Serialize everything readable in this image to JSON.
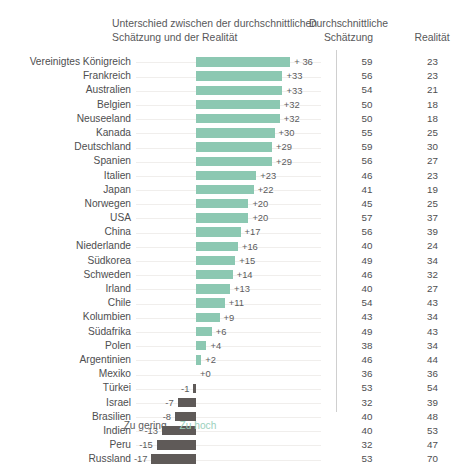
{
  "header": {
    "diff_title": "Unterschied zwischen der durchschnittlichen Schätzung und der Realität",
    "estimate_title": "Durchschnittliche Schätzung",
    "reality_title": "Realität"
  },
  "legend": {
    "low_label": "Zu gering",
    "high_label": "Zu hoch"
  },
  "colors": {
    "positive_bar": "#8cc8b2",
    "negative_bar": "#5f5a58",
    "text": "#4e4e50",
    "divider": "#cfcfcf",
    "leader": "#f0eeec"
  },
  "chart_data": {
    "type": "bar",
    "orientation": "horizontal",
    "title": "Unterschied zwischen der durchschnittlichen Schätzung und der Realität",
    "xlabel": "",
    "ylabel": "",
    "grid": false,
    "legend_position": "bottom",
    "legend_entries": [
      "Zu gering",
      "Zu hoch"
    ],
    "xlim": [
      -20,
      40
    ],
    "columns": [
      "Durchschnittliche Schätzung",
      "Realität"
    ],
    "categories": [
      "Vereinigtes Königreich",
      "Frankreich",
      "Australien",
      "Belgien",
      "Neuseeland",
      "Kanada",
      "Deutschland",
      "Spanien",
      "Italien",
      "Japan",
      "Norwegen",
      "USA",
      "China",
      "Niederlande",
      "Südkorea",
      "Schweden",
      "Irland",
      "Chile",
      "Kolumbien",
      "Südafrika",
      "Polen",
      "Argentinien",
      "Mexiko",
      "Türkei",
      "Israel",
      "Brasilien",
      "Indien",
      "Peru",
      "Russland"
    ],
    "values": [
      36,
      33,
      33,
      32,
      32,
      30,
      29,
      29,
      23,
      22,
      20,
      20,
      17,
      16,
      15,
      14,
      13,
      11,
      9,
      6,
      4,
      2,
      0,
      -1,
      -7,
      -8,
      -13,
      -15,
      -17
    ],
    "series": [
      {
        "name": "Durchschnittliche Schätzung",
        "values": [
          59,
          56,
          54,
          50,
          50,
          55,
          59,
          56,
          46,
          41,
          45,
          57,
          56,
          40,
          49,
          46,
          40,
          54,
          43,
          49,
          38,
          46,
          36,
          53,
          32,
          40,
          40,
          32,
          53
        ]
      },
      {
        "name": "Realität",
        "values": [
          23,
          23,
          21,
          18,
          18,
          25,
          30,
          27,
          23,
          19,
          25,
          37,
          39,
          24,
          34,
          32,
          27,
          43,
          34,
          43,
          34,
          44,
          36,
          54,
          39,
          48,
          53,
          47,
          70
        ]
      }
    ]
  },
  "rows": [
    {
      "country": "Vereinigtes Königreich",
      "diff": 36,
      "diff_label": "+ 36",
      "estimate": 59,
      "reality": 23
    },
    {
      "country": "Frankreich",
      "diff": 33,
      "diff_label": "+33",
      "estimate": 56,
      "reality": 23
    },
    {
      "country": "Australien",
      "diff": 33,
      "diff_label": "+33",
      "estimate": 54,
      "reality": 21
    },
    {
      "country": "Belgien",
      "diff": 32,
      "diff_label": "+32",
      "estimate": 50,
      "reality": 18
    },
    {
      "country": "Neuseeland",
      "diff": 32,
      "diff_label": "+32",
      "estimate": 50,
      "reality": 18
    },
    {
      "country": "Kanada",
      "diff": 30,
      "diff_label": "+30",
      "estimate": 55,
      "reality": 25
    },
    {
      "country": "Deutschland",
      "diff": 29,
      "diff_label": "+29",
      "estimate": 59,
      "reality": 30
    },
    {
      "country": "Spanien",
      "diff": 29,
      "diff_label": "+29",
      "estimate": 56,
      "reality": 27
    },
    {
      "country": "Italien",
      "diff": 23,
      "diff_label": "+23",
      "estimate": 46,
      "reality": 23
    },
    {
      "country": "Japan",
      "diff": 22,
      "diff_label": "+22",
      "estimate": 41,
      "reality": 19
    },
    {
      "country": "Norwegen",
      "diff": 20,
      "diff_label": "+20",
      "estimate": 45,
      "reality": 25
    },
    {
      "country": "USA",
      "diff": 20,
      "diff_label": "+20",
      "estimate": 57,
      "reality": 37
    },
    {
      "country": "China",
      "diff": 17,
      "diff_label": "+17",
      "estimate": 56,
      "reality": 39
    },
    {
      "country": "Niederlande",
      "diff": 16,
      "diff_label": "+16",
      "estimate": 40,
      "reality": 24
    },
    {
      "country": "Südkorea",
      "diff": 15,
      "diff_label": "+15",
      "estimate": 49,
      "reality": 34
    },
    {
      "country": "Schweden",
      "diff": 14,
      "diff_label": "+14",
      "estimate": 46,
      "reality": 32
    },
    {
      "country": "Irland",
      "diff": 13,
      "diff_label": "+13",
      "estimate": 40,
      "reality": 27
    },
    {
      "country": "Chile",
      "diff": 11,
      "diff_label": "+11",
      "estimate": 54,
      "reality": 43
    },
    {
      "country": "Kolumbien",
      "diff": 9,
      "diff_label": "+9",
      "estimate": 43,
      "reality": 34
    },
    {
      "country": "Südafrika",
      "diff": 6,
      "diff_label": "+6",
      "estimate": 49,
      "reality": 43
    },
    {
      "country": "Polen",
      "diff": 4,
      "diff_label": "+4",
      "estimate": 38,
      "reality": 34
    },
    {
      "country": "Argentinien",
      "diff": 2,
      "diff_label": "+2",
      "estimate": 46,
      "reality": 44
    },
    {
      "country": "Mexiko",
      "diff": 0,
      "diff_label": "+0",
      "estimate": 36,
      "reality": 36
    },
    {
      "country": "Türkei",
      "diff": -1,
      "diff_label": "-1",
      "estimate": 53,
      "reality": 54
    },
    {
      "country": "Israel",
      "diff": -7,
      "diff_label": "-7",
      "estimate": 32,
      "reality": 39
    },
    {
      "country": "Brasilien",
      "diff": -8,
      "diff_label": "-8",
      "estimate": 40,
      "reality": 48
    },
    {
      "country": "Indien",
      "diff": -13,
      "diff_label": "-13",
      "estimate": 40,
      "reality": 53
    },
    {
      "country": "Peru",
      "diff": -15,
      "diff_label": "-15",
      "estimate": 32,
      "reality": 47
    },
    {
      "country": "Russland",
      "diff": -17,
      "diff_label": "-17",
      "estimate": 53,
      "reality": 70
    }
  ]
}
